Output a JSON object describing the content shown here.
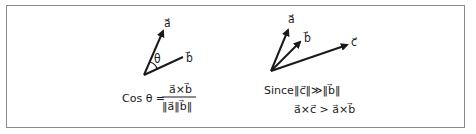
{
  "diagram": {
    "left_panel": {
      "vectors": [
        {
          "name": "a",
          "label": "a⃗"
        },
        {
          "name": "b",
          "label": "b⃗"
        }
      ],
      "angle_label": "θ",
      "formula": {
        "lhs": "Cos θ =",
        "numerator": "a⃗×b⃗",
        "denominator": "‖a⃗‖b⃗‖"
      }
    },
    "right_panel": {
      "vectors": [
        {
          "name": "a",
          "label": "a⃗"
        },
        {
          "name": "b",
          "label": "b⃗"
        },
        {
          "name": "c",
          "label": "c⃗"
        }
      ],
      "since_label": "Since",
      "condition": "‖c⃗‖≫‖b⃗‖",
      "conclusion": "a⃗×c⃗ > a⃗×b⃗"
    },
    "colors": {
      "border": "#8a8a8a",
      "ink": "#1a1a1a",
      "background": "#ffffff"
    }
  }
}
